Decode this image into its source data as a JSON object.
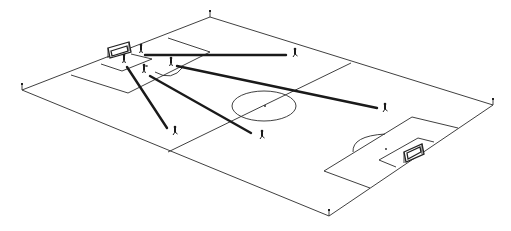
{
  "diagram": {
    "type": "isometric soccer pitch tactical diagram",
    "colors": {
      "background": "#ffffff",
      "pitch_lines": "#2a2a2a",
      "pass_lines": "#1a1a1a",
      "players": "#1a1a1a"
    },
    "pitch": {
      "corners": [
        [
          210,
          17
        ],
        [
          493,
          105
        ],
        [
          329,
          216
        ],
        [
          22,
          90
        ]
      ],
      "halfway_line": [
        [
          351,
          63
        ],
        [
          168,
          152
        ]
      ],
      "center_circle": {
        "cx": 264,
        "cy": 106,
        "rx": 32,
        "ry": 15
      },
      "center_spot": [
        265,
        106
      ]
    },
    "goals": [
      {
        "name": "left-goal",
        "x": 106,
        "y": 44
      },
      {
        "name": "right-goal",
        "x": 404,
        "y": 146
      }
    ],
    "players": [
      {
        "id": "p1",
        "x": 124,
        "y": 60
      },
      {
        "id": "p2",
        "x": 141,
        "y": 50
      },
      {
        "id": "p3",
        "x": 144,
        "y": 69
      },
      {
        "id": "p4",
        "x": 171,
        "y": 62
      },
      {
        "id": "p5",
        "x": 295,
        "y": 53
      },
      {
        "id": "p6",
        "x": 385,
        "y": 108
      },
      {
        "id": "p7",
        "x": 175,
        "y": 131
      },
      {
        "id": "p8",
        "x": 262,
        "y": 135
      }
    ],
    "passes": [
      {
        "from": [
          145,
          55
        ],
        "to": [
          286,
          55
        ]
      },
      {
        "from": [
          177,
          66
        ],
        "to": [
          377,
          108
        ]
      },
      {
        "from": [
          127,
          67
        ],
        "to": [
          167,
          128
        ]
      },
      {
        "from": [
          150,
          76
        ],
        "to": [
          251,
          133
        ]
      }
    ],
    "corner_flags": [
      [
        210,
        17
      ],
      [
        493,
        105
      ],
      [
        329,
        216
      ],
      [
        22,
        90
      ]
    ]
  }
}
